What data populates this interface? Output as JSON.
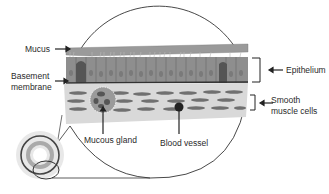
{
  "diagram": {
    "labels": {
      "mucus": "Mucus",
      "basement_membrane_line1": "Basement",
      "basement_membrane_line2": "membrane",
      "epithelium": "Epithelium",
      "smooth_muscle_line1": "Smooth",
      "smooth_muscle_line2": "muscle cells",
      "mucous_gland": "Mucous gland",
      "blood_vessel": "Blood vessel"
    },
    "colors": {
      "mucus": "#9a9a9a",
      "epithelium": "#8c8c8c",
      "epithelium_dark": "#555555",
      "submucosa": "#d9d9d9",
      "muscle": "#6e6e6e",
      "outline": "#333333"
    }
  }
}
